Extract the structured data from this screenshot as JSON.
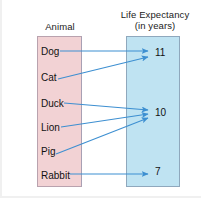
{
  "diagram": {
    "type": "mapping-diagram",
    "domain": {
      "heading": "Animal",
      "box_color": "#f2d2d4",
      "elements": [
        {
          "label": "Dog",
          "y": 52
        },
        {
          "label": "Cat",
          "y": 78
        },
        {
          "label": "Duck",
          "y": 104
        },
        {
          "label": "Lion",
          "y": 128
        },
        {
          "label": "Pig",
          "y": 152
        },
        {
          "label": "Rabbit",
          "y": 176
        }
      ]
    },
    "range": {
      "heading_line1": "Life Expectancy",
      "heading_line2": "(in years)",
      "box_color": "#bfe3f2",
      "elements": [
        {
          "label": "11",
          "y": 53
        },
        {
          "label": "10",
          "y": 113
        },
        {
          "label": "7",
          "y": 172
        }
      ]
    },
    "arrow_color": "#3d8fd1",
    "mappings": [
      {
        "from": "Dog",
        "to": "11"
      },
      {
        "from": "Cat",
        "to": "11"
      },
      {
        "from": "Duck",
        "to": "10"
      },
      {
        "from": "Lion",
        "to": "10"
      },
      {
        "from": "Pig",
        "to": "10"
      },
      {
        "from": "Rabbit",
        "to": "7"
      }
    ]
  }
}
